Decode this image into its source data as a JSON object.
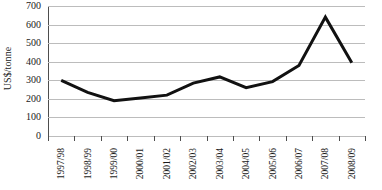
{
  "chart_data": {
    "type": "line",
    "title": "",
    "xlabel": "",
    "ylabel": "US$/tonne",
    "categories": [
      "1997/98",
      "1998/99",
      "1999/00",
      "2000/01",
      "2001/02",
      "2002/03",
      "2003/04",
      "2004/05",
      "2005/06",
      "2006/07",
      "2007/08",
      "2008/09"
    ],
    "values": [
      300,
      235,
      190,
      205,
      220,
      285,
      318,
      260,
      293,
      380,
      640,
      395
    ],
    "ylim": [
      0,
      700
    ],
    "yticks": [
      0,
      100,
      200,
      300,
      400,
      500,
      600,
      700
    ],
    "ytick_labels": [
      "0",
      "100",
      "200",
      "300",
      "400",
      "500",
      "600",
      "700"
    ],
    "grid": true,
    "grid_axis": "y",
    "legend": false,
    "legend_position": "none",
    "markers": false,
    "series": [
      {
        "name": "US$/tonne",
        "values": [
          300,
          235,
          190,
          205,
          220,
          285,
          318,
          260,
          293,
          380,
          640,
          395
        ]
      }
    ]
  },
  "style": {
    "line_color": "#111111",
    "grid_color": "#bcbcbc",
    "axis_color": "#4d4d4d",
    "text_color": "#1a1a1a",
    "background": "#ffffff",
    "line_width": 3
  }
}
